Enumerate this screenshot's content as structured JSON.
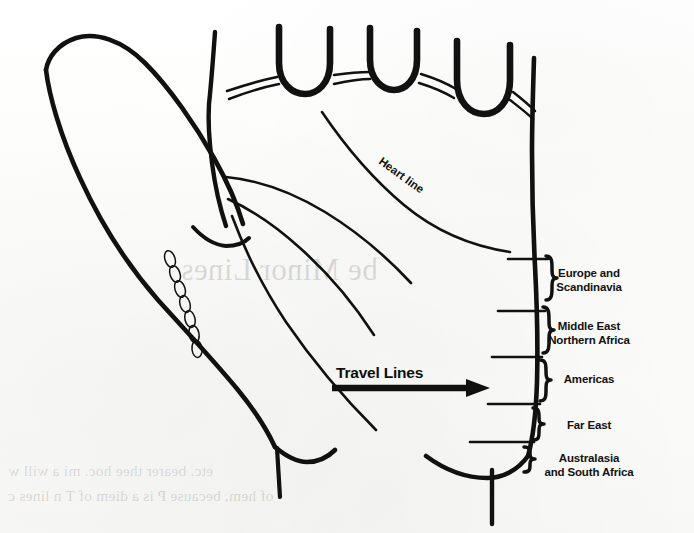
{
  "figure": {
    "kind": "palmistry-hand-diagram",
    "background_color": "#fdfdfc",
    "ink_color": "#111111"
  },
  "annotations": {
    "heart_line_label": "Heart line",
    "travel_lines_label": "Travel Lines"
  },
  "zones": [
    {
      "id": "europe-scandinavia",
      "label": "Europe and\nScandinavia",
      "x": 589,
      "y": 274
    },
    {
      "id": "middle-east-northern-africa",
      "label": "Middle East\nNorthern Africa",
      "x": 589,
      "y": 327
    },
    {
      "id": "americas",
      "label": "Americas",
      "x": 589,
      "y": 380
    },
    {
      "id": "far-east",
      "label": "Far East",
      "x": 589,
      "y": 426
    },
    {
      "id": "australasia-south-africa",
      "label": "Australasia\nand South Africa",
      "x": 589,
      "y": 459
    }
  ],
  "bleedthrough": {
    "heading": "be Minor Lines",
    "line1": "etc. bearer thee            hoc. mi  a   will w",
    "line2": "of hem, because P is a diem of T    n   lines c"
  }
}
